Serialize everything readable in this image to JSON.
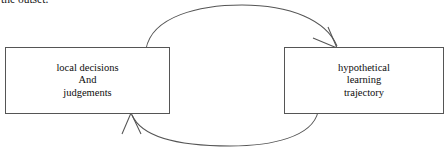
{
  "page": {
    "width": 448,
    "height": 154,
    "background_color": "#ffffff",
    "body_text_fragment": "the outset."
  },
  "diagram": {
    "title": "",
    "type": "cyclic-two-node-feedback-loop",
    "stroke_color": "#555555",
    "nodes": [
      {
        "id": "local-decisions",
        "lines": [
          "local decisions",
          "And",
          "judgements"
        ],
        "line1": "local decisions",
        "line2": "And",
        "line3": "judgements"
      },
      {
        "id": "hypothetical-trajectory",
        "lines": [
          "hypothetical",
          "learning",
          "trajectory"
        ],
        "line1": "hypothetical",
        "line2": "learning",
        "line3": "trajectory"
      }
    ],
    "edges": [
      {
        "id": "top-arc",
        "label": "",
        "from": "local-decisions",
        "to": "hypothetical-trajectory",
        "direction": "left-to-right",
        "shape": "arc-over-top"
      },
      {
        "id": "bottom-arc",
        "label": "",
        "from": "hypothetical-trajectory",
        "to": "local-decisions",
        "direction": "right-to-left",
        "shape": "arc-under-bottom"
      }
    ]
  }
}
